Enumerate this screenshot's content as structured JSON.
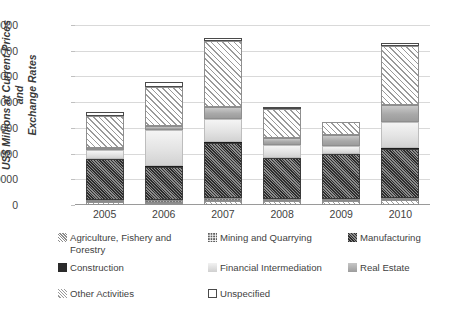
{
  "chart_data": {
    "type": "bar",
    "stacked": true,
    "title": "",
    "xlabel": "",
    "ylabel": "US$ Millions at Current Prices and Exchange Rates",
    "categories": [
      "2005",
      "2006",
      "2007",
      "2008",
      "2009",
      "2010"
    ],
    "ylim": [
      0,
      70000
    ],
    "ytick_labels": [
      "0",
      "10000",
      "20000",
      "30000",
      "40000",
      "50000",
      "60000",
      "70000"
    ],
    "ytick_values": [
      0,
      10000,
      20000,
      30000,
      40000,
      50000,
      60000,
      70000
    ],
    "grid": true,
    "legend_position": "bottom",
    "series": [
      {
        "name": "Agriculture, Fishery and Forestry",
        "pattern": "diagonal-stripes-light",
        "values": [
          1200,
          900,
          1700,
          1400,
          1500,
          1900
        ]
      },
      {
        "name": "Mining and Quarrying",
        "pattern": "dotted-gray",
        "values": [
          700,
          900,
          900,
          900,
          800,
          900
        ]
      },
      {
        "name": "Manufacturing",
        "pattern": "dense-crosshatch-dark",
        "values": [
          15900,
          12900,
          21600,
          15800,
          17400,
          19100
        ]
      },
      {
        "name": "Construction",
        "pattern": "solid-black",
        "values": [
          200,
          300,
          400,
          300,
          200,
          300
        ]
      },
      {
        "name": "Financial Intermediation",
        "pattern": "light-gradient",
        "values": [
          3500,
          14200,
          9000,
          4800,
          2900,
          10100
        ]
      },
      {
        "name": "Real Estate",
        "pattern": "medium-gray-gradient",
        "values": [
          700,
          1400,
          4600,
          3000,
          4400,
          6500
        ]
      },
      {
        "name": "Other Activities",
        "pattern": "diagonal-hatch",
        "values": [
          12400,
          15400,
          25600,
          11100,
          5000,
          22900
        ]
      },
      {
        "name": "Unspecified",
        "pattern": "white-outline",
        "values": [
          1400,
          2000,
          1200,
          400,
          0,
          1300
        ]
      }
    ],
    "totals": [
      36000,
      48000,
      65000,
      37700,
      32200,
      63000
    ]
  },
  "axis": {
    "y_title_line1": "US$ Millions at Current Prices and",
    "y_title_line2": "Exchange Rates"
  },
  "legend": {
    "items": [
      {
        "label": "Agriculture, Fishery and",
        "label2": "Forestry",
        "swatch": "p-agri",
        "icon": "agriculture-swatch-icon"
      },
      {
        "label": "Mining and Quarrying",
        "label2": "",
        "swatch": "p-mining",
        "icon": "mining-swatch-icon"
      },
      {
        "label": "Manufacturing",
        "label2": "",
        "swatch": "p-manu",
        "icon": "manufacturing-swatch-icon"
      },
      {
        "label": "Construction",
        "label2": "",
        "swatch": "p-constr",
        "icon": "construction-swatch-icon"
      },
      {
        "label": "Financial Intermediation",
        "label2": "",
        "swatch": "p-finance",
        "icon": "financial-swatch-icon"
      },
      {
        "label": "Real Estate",
        "label2": "",
        "swatch": "p-realestate",
        "icon": "real-estate-swatch-icon"
      },
      {
        "label": "Other Activities",
        "label2": "",
        "swatch": "p-other",
        "icon": "other-activities-swatch-icon"
      },
      {
        "label": "Unspecified",
        "label2": "",
        "swatch": "p-unspec",
        "icon": "unspecified-swatch-icon"
      }
    ]
  },
  "colors": {
    "gridline": "#d9d9d9",
    "axis": "#9a9a9a",
    "text": "#3f3f3f",
    "construction": "#2b2b2b",
    "manufacturing": "#4a4a4a",
    "real_estate": "#a9a9a9",
    "financial": "#e3e3e3"
  }
}
